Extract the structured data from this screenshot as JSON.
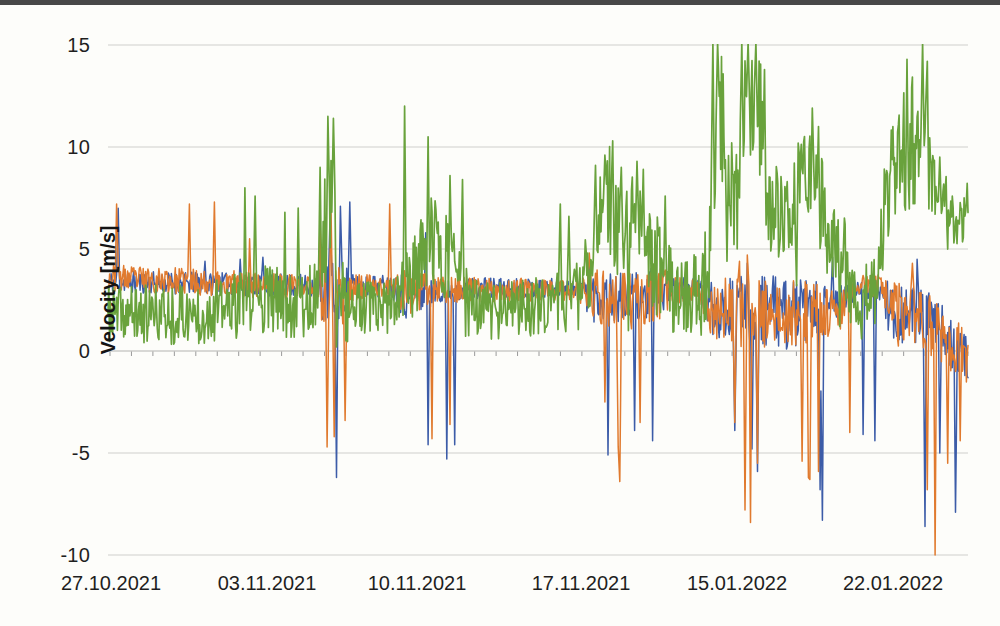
{
  "page": {
    "scan_bar_color": "#484848",
    "paper_color": "#fdfdfa"
  },
  "chart_data": {
    "type": "line",
    "title": "",
    "xlabel": "",
    "ylabel": "Velocity [m/s]",
    "ylim": [
      -10,
      15
    ],
    "y_ticks": [
      15,
      10,
      5,
      0,
      -5,
      -10
    ],
    "y_tick_labels": [
      "15",
      "10",
      "5",
      "0",
      "-5",
      "-10"
    ],
    "x_tick_labels": [
      "27.10.2021",
      "03.11.2021",
      "10.11.2021",
      "17.11.2021",
      "15.01.2022",
      "22.01.2022"
    ],
    "grid": "horizontal-only",
    "legend": "none",
    "axis_note": "x axis crosses at 0 with daily minor ticks; labels weekly, axis is categorical with a gap between 17.11.2021 and 15.01.2022",
    "axis_colors": {
      "gridline": "#cfcfcc",
      "zero_axis": "#b3b3b0",
      "tick": "#9a9a9a",
      "text": "#1f1f1f"
    },
    "series": [
      {
        "name": "velocity-blue",
        "color": "#3c5ca8",
        "width": 1.5,
        "seed": 11,
        "anchors": [
          [
            0,
            3.4
          ],
          [
            0.24,
            3.2
          ],
          [
            0.25,
            2.8
          ],
          [
            0.27,
            2.8
          ],
          [
            0.28,
            3.2
          ],
          [
            0.33,
            3.2
          ],
          [
            0.345,
            2.8
          ],
          [
            0.38,
            2.9
          ],
          [
            0.42,
            3.1
          ],
          [
            0.545,
            3.1
          ],
          [
            0.565,
            2.7
          ],
          [
            0.6,
            2.5
          ],
          [
            0.636,
            2.8
          ],
          [
            0.65,
            3
          ],
          [
            0.69,
            3
          ],
          [
            0.7,
            2.2
          ],
          [
            0.77,
            2
          ],
          [
            0.79,
            1.8
          ],
          [
            0.85,
            2.2
          ],
          [
            0.87,
            3
          ],
          [
            0.9,
            3
          ],
          [
            0.91,
            2
          ],
          [
            0.96,
            1.5
          ],
          [
            1,
            -0.5
          ]
        ],
        "noise": [
          [
            0,
            0.55
          ],
          [
            0.24,
            0.55
          ],
          [
            0.25,
            1.6
          ],
          [
            0.27,
            1.6
          ],
          [
            0.285,
            0.55
          ],
          [
            0.33,
            0.55
          ],
          [
            0.345,
            1.3
          ],
          [
            0.385,
            0.55
          ],
          [
            0.545,
            0.45
          ],
          [
            0.565,
            1.3
          ],
          [
            0.636,
            1.3
          ],
          [
            0.655,
            0.6
          ],
          [
            0.69,
            0.6
          ],
          [
            0.7,
            1.5
          ],
          [
            0.79,
            1.8
          ],
          [
            0.85,
            1.1
          ],
          [
            0.87,
            0.5
          ],
          [
            0.9,
            0.5
          ],
          [
            0.91,
            1.6
          ],
          [
            1,
            1.2
          ]
        ],
        "spikes": [
          [
            0.012,
            7
          ],
          [
            0.113,
            4.4
          ],
          [
            0.154,
            4.5
          ],
          [
            0.18,
            4.6
          ],
          [
            0.258,
            6.9
          ],
          [
            0.266,
            -6.2
          ],
          [
            0.27,
            7.1
          ],
          [
            0.281,
            7.3
          ],
          [
            0.369,
            5.8
          ],
          [
            0.372,
            -4.6
          ],
          [
            0.394,
            -5.3
          ],
          [
            0.403,
            -4.6
          ],
          [
            0.56,
            4.3
          ],
          [
            0.581,
            -5.1
          ],
          [
            0.612,
            -3.9
          ],
          [
            0.633,
            -4.4
          ],
          [
            0.729,
            -3.9
          ],
          [
            0.743,
            4.3
          ],
          [
            0.749,
            -4.8
          ],
          [
            0.755,
            -5.9
          ],
          [
            0.828,
            -6.8
          ],
          [
            0.831,
            -8.3
          ],
          [
            0.843,
            4.6
          ],
          [
            0.878,
            -4.1
          ],
          [
            0.892,
            -4.4
          ],
          [
            0.941,
            4.5
          ],
          [
            0.95,
            -8.6
          ],
          [
            0.967,
            -5
          ],
          [
            0.985,
            -7.9
          ]
        ]
      },
      {
        "name": "velocity-orange",
        "color": "#e07a2e",
        "width": 1.5,
        "seed": 23,
        "anchors": [
          [
            0,
            3.6
          ],
          [
            0.24,
            3.1
          ],
          [
            0.25,
            2.6
          ],
          [
            0.272,
            2.8
          ],
          [
            0.285,
            3.1
          ],
          [
            0.33,
            3.1
          ],
          [
            0.345,
            2.9
          ],
          [
            0.385,
            3
          ],
          [
            0.545,
            3
          ],
          [
            0.565,
            2.6
          ],
          [
            0.61,
            2.4
          ],
          [
            0.64,
            2.9
          ],
          [
            0.69,
            2.9
          ],
          [
            0.7,
            2
          ],
          [
            0.77,
            1.8
          ],
          [
            0.85,
            2
          ],
          [
            0.87,
            3.2
          ],
          [
            0.9,
            3.2
          ],
          [
            0.91,
            1.8
          ],
          [
            0.96,
            1.2
          ],
          [
            1,
            -0.4
          ]
        ],
        "noise": [
          [
            0,
            0.65
          ],
          [
            0.24,
            0.65
          ],
          [
            0.25,
            1.6
          ],
          [
            0.275,
            1.6
          ],
          [
            0.29,
            0.65
          ],
          [
            0.33,
            0.65
          ],
          [
            0.345,
            1.2
          ],
          [
            0.39,
            0.65
          ],
          [
            0.545,
            0.5
          ],
          [
            0.565,
            1.4
          ],
          [
            0.64,
            1.4
          ],
          [
            0.66,
            0.7
          ],
          [
            0.69,
            0.7
          ],
          [
            0.7,
            1.6
          ],
          [
            0.79,
            1.8
          ],
          [
            0.85,
            1.1
          ],
          [
            0.87,
            0.5
          ],
          [
            0.9,
            0.6
          ],
          [
            0.91,
            1.7
          ],
          [
            1,
            1.3
          ]
        ],
        "spikes": [
          [
            0.01,
            7.2
          ],
          [
            0.095,
            7.2
          ],
          [
            0.124,
            7.3
          ],
          [
            0.165,
            5.5
          ],
          [
            0.247,
            6.5
          ],
          [
            0.255,
            -4.7
          ],
          [
            0.259,
            7
          ],
          [
            0.263,
            -4.2
          ],
          [
            0.276,
            -3.4
          ],
          [
            0.328,
            7.2
          ],
          [
            0.377,
            -4.3
          ],
          [
            0.398,
            -3.6
          ],
          [
            0.56,
            4.8
          ],
          [
            0.578,
            -2.5
          ],
          [
            0.593,
            -4.7
          ],
          [
            0.595,
            -6.4
          ],
          [
            0.619,
            -3.5
          ],
          [
            0.729,
            -3.5
          ],
          [
            0.734,
            4.4
          ],
          [
            0.741,
            -7.8
          ],
          [
            0.743,
            4.7
          ],
          [
            0.747,
            -8.4
          ],
          [
            0.755,
            -5.5
          ],
          [
            0.807,
            -5.4
          ],
          [
            0.814,
            -6.2
          ],
          [
            0.816,
            -6.3
          ],
          [
            0.826,
            -5.9
          ],
          [
            0.863,
            -4
          ],
          [
            0.935,
            4.3
          ],
          [
            0.953,
            -6.8
          ],
          [
            0.962,
            -10
          ],
          [
            0.976,
            -5.5
          ],
          [
            0.991,
            -4.4
          ]
        ]
      },
      {
        "name": "velocity-green",
        "color": "#69a23c",
        "width": 1.7,
        "seed": 37,
        "anchors": [
          [
            0,
            1.8
          ],
          [
            0.1,
            1.8
          ],
          [
            0.15,
            2.2
          ],
          [
            0.185,
            2.6
          ],
          [
            0.21,
            2.2
          ],
          [
            0.24,
            2.6
          ],
          [
            0.248,
            4
          ],
          [
            0.252,
            6
          ],
          [
            0.258,
            7.5
          ],
          [
            0.264,
            6
          ],
          [
            0.27,
            3
          ],
          [
            0.28,
            2
          ],
          [
            0.33,
            2
          ],
          [
            0.34,
            3
          ],
          [
            0.352,
            3.5
          ],
          [
            0.36,
            3.8
          ],
          [
            0.372,
            5.5
          ],
          [
            0.385,
            5
          ],
          [
            0.4,
            4.5
          ],
          [
            0.415,
            2.5
          ],
          [
            0.425,
            2
          ],
          [
            0.47,
            2
          ],
          [
            0.52,
            2.4
          ],
          [
            0.545,
            2.6
          ],
          [
            0.56,
            4
          ],
          [
            0.57,
            6.5
          ],
          [
            0.58,
            7.5
          ],
          [
            0.587,
            7
          ],
          [
            0.595,
            6
          ],
          [
            0.605,
            5.5
          ],
          [
            0.615,
            6.5
          ],
          [
            0.628,
            5
          ],
          [
            0.64,
            4
          ],
          [
            0.655,
            3
          ],
          [
            0.67,
            2.8
          ],
          [
            0.69,
            2.6
          ],
          [
            0.7,
            5
          ],
          [
            0.706,
            9.5
          ],
          [
            0.712,
            12
          ],
          [
            0.718,
            10
          ],
          [
            0.724,
            8
          ],
          [
            0.731,
            7
          ],
          [
            0.738,
            10.5
          ],
          [
            0.745,
            12.5
          ],
          [
            0.752,
            12
          ],
          [
            0.76,
            11
          ],
          [
            0.767,
            8
          ],
          [
            0.775,
            6.8
          ],
          [
            0.79,
            6.5
          ],
          [
            0.8,
            7.5
          ],
          [
            0.812,
            9
          ],
          [
            0.82,
            8.5
          ],
          [
            0.832,
            6.5
          ],
          [
            0.845,
            6
          ],
          [
            0.855,
            5
          ],
          [
            0.862,
            3
          ],
          [
            0.875,
            2.2
          ],
          [
            0.893,
            3.5
          ],
          [
            0.905,
            7
          ],
          [
            0.925,
            10
          ],
          [
            0.945,
            10.5
          ],
          [
            0.955,
            9
          ],
          [
            0.968,
            7
          ],
          [
            0.985,
            6.5
          ],
          [
            1,
            7.2
          ]
        ],
        "noise": [
          [
            0,
            1.4
          ],
          [
            0.15,
            1.6
          ],
          [
            0.24,
            1.8
          ],
          [
            0.252,
            3
          ],
          [
            0.27,
            2
          ],
          [
            0.29,
            1.5
          ],
          [
            0.34,
            1.5
          ],
          [
            0.36,
            2.2
          ],
          [
            0.4,
            2.2
          ],
          [
            0.43,
            1.5
          ],
          [
            0.52,
            1.4
          ],
          [
            0.56,
            2
          ],
          [
            0.58,
            2.8
          ],
          [
            0.64,
            2.5
          ],
          [
            0.67,
            1.8
          ],
          [
            0.7,
            2.5
          ],
          [
            0.712,
            3
          ],
          [
            0.76,
            3
          ],
          [
            0.79,
            1.8
          ],
          [
            0.812,
            2.8
          ],
          [
            0.845,
            2.5
          ],
          [
            0.875,
            1.4
          ],
          [
            0.905,
            3
          ],
          [
            0.935,
            3.3
          ],
          [
            0.96,
            2
          ],
          [
            1,
            1.5
          ]
        ],
        "spikes": [
          [
            0.159,
            8
          ],
          [
            0.171,
            7.6
          ],
          [
            0.206,
            6.8
          ],
          [
            0.221,
            7
          ],
          [
            0.247,
            9
          ],
          [
            0.256,
            11.5
          ],
          [
            0.262,
            11.4
          ],
          [
            0.266,
            0.2
          ],
          [
            0.345,
            12
          ],
          [
            0.372,
            10.5
          ],
          [
            0.398,
            8.6
          ],
          [
            0.412,
            8.4
          ],
          [
            0.526,
            7.2
          ],
          [
            0.536,
            6.6
          ],
          [
            0.567,
            9.1
          ],
          [
            0.578,
            9.6
          ],
          [
            0.587,
            10.3
          ],
          [
            0.597,
            9
          ],
          [
            0.605,
            1
          ],
          [
            0.615,
            9.3
          ],
          [
            0.622,
            8.9
          ],
          [
            0.648,
            7.6
          ],
          [
            0.703,
            15.3
          ],
          [
            0.709,
            15.3
          ],
          [
            0.72,
            4.4
          ],
          [
            0.737,
            15.3
          ],
          [
            0.744,
            15.3
          ],
          [
            0.753,
            15.3
          ],
          [
            0.763,
            13.8
          ],
          [
            0.79,
            8.3
          ],
          [
            0.801,
            3.2
          ],
          [
            0.819,
            11.9
          ],
          [
            0.826,
            11
          ],
          [
            0.851,
            1.2
          ],
          [
            0.876,
            0.6
          ],
          [
            0.929,
            14.3
          ],
          [
            0.947,
            15.2
          ],
          [
            0.953,
            14.2
          ],
          [
            0.967,
            9.5
          ]
        ]
      }
    ]
  }
}
